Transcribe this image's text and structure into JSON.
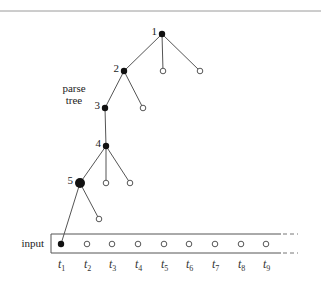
{
  "diagram": {
    "parse_tree_label": [
      "parse",
      "tree"
    ],
    "input_label": "input",
    "nodes": [
      {
        "id": "1",
        "label": "1",
        "x": 162,
        "y": 34,
        "type": "filled"
      },
      {
        "id": "2",
        "label": "2",
        "x": 124,
        "y": 71,
        "type": "filled"
      },
      {
        "id": "1b",
        "label": "",
        "x": 163,
        "y": 71,
        "type": "hollow"
      },
      {
        "id": "1c",
        "label": "",
        "x": 200,
        "y": 71,
        "type": "hollow"
      },
      {
        "id": "3",
        "label": "3",
        "x": 105,
        "y": 108,
        "type": "filled"
      },
      {
        "id": "2b",
        "label": "",
        "x": 143,
        "y": 108,
        "type": "hollow"
      },
      {
        "id": "4",
        "label": "4",
        "x": 106,
        "y": 146,
        "type": "filled"
      },
      {
        "id": "5",
        "label": "5",
        "x": 80,
        "y": 183,
        "type": "filled-large"
      },
      {
        "id": "4b",
        "label": "",
        "x": 106,
        "y": 183,
        "type": "hollow"
      },
      {
        "id": "4c",
        "label": "",
        "x": 130,
        "y": 183,
        "type": "hollow"
      },
      {
        "id": "5b",
        "label": "",
        "x": 99,
        "y": 219,
        "type": "hollow"
      }
    ],
    "edges": [
      [
        "1",
        "2"
      ],
      [
        "1",
        "1b"
      ],
      [
        "1",
        "1c"
      ],
      [
        "2",
        "3"
      ],
      [
        "2",
        "2b"
      ],
      [
        "3",
        "4"
      ],
      [
        "4",
        "5"
      ],
      [
        "4",
        "4b"
      ],
      [
        "4",
        "4c"
      ],
      [
        "5",
        "t1"
      ],
      [
        "5",
        "5b"
      ]
    ],
    "tokens": [
      {
        "name": "t",
        "sub": "1",
        "x": 61,
        "filled": true
      },
      {
        "name": "t",
        "sub": "2",
        "x": 87,
        "filled": false
      },
      {
        "name": "t",
        "sub": "3",
        "x": 112,
        "filled": false
      },
      {
        "name": "t",
        "sub": "4",
        "x": 138,
        "filled": false
      },
      {
        "name": "t",
        "sub": "5",
        "x": 164,
        "filled": false
      },
      {
        "name": "t",
        "sub": "6",
        "x": 189,
        "filled": false
      },
      {
        "name": "t",
        "sub": "7",
        "x": 215,
        "filled": false
      },
      {
        "name": "t",
        "sub": "8",
        "x": 241,
        "filled": false
      },
      {
        "name": "t",
        "sub": "9",
        "x": 266,
        "filled": false
      }
    ],
    "colors": {
      "ink": "#111111",
      "line": "#555555",
      "rule": "#9a9a9a",
      "background": "#ffffff"
    }
  }
}
